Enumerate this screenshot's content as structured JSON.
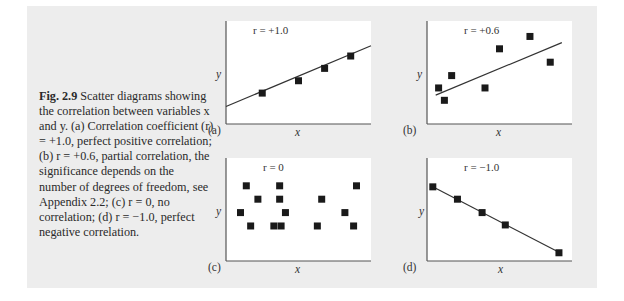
{
  "caption": {
    "figure_label": "Fig. 2.9",
    "text": "Scatter diagrams showing the correlation between variables x and y. (a) Correlation coefficient (r) = +1.0, perfect positive correlation; (b) r = +0.6, partial correlation, the significance depends on the number of degrees of freedom, see Appendix 2.2; (c) r = 0, no correlation; (d) r = −1.0, perfect negative correlation."
  },
  "chart_data": [
    {
      "type": "scatter",
      "panel": "(a)",
      "annotation": "r = +1.0",
      "xlabel": "x",
      "ylabel": "y",
      "trendline": true,
      "points": [
        [
          25,
          30
        ],
        [
          50,
          42
        ],
        [
          68,
          54
        ],
        [
          86,
          66
        ]
      ],
      "line": [
        [
          0,
          17
        ],
        [
          100,
          76
        ]
      ],
      "xlim": [
        0,
        100
      ],
      "ylim": [
        0,
        100
      ]
    },
    {
      "type": "scatter",
      "panel": "(b)",
      "annotation": "r = +0.6",
      "xlabel": "x",
      "ylabel": "y",
      "trendline": true,
      "points": [
        [
          8,
          35
        ],
        [
          12,
          23
        ],
        [
          17,
          47
        ],
        [
          40,
          35
        ],
        [
          50,
          73
        ],
        [
          71,
          85
        ],
        [
          85,
          60
        ]
      ],
      "line": [
        [
          6,
          28
        ],
        [
          93,
          79
        ]
      ],
      "xlim": [
        0,
        100
      ],
      "ylim": [
        0,
        100
      ]
    },
    {
      "type": "scatter",
      "panel": "(c)",
      "annotation": "r = 0",
      "xlabel": "x",
      "ylabel": "y",
      "trendline": false,
      "points": [
        [
          14,
          73
        ],
        [
          22,
          60
        ],
        [
          10,
          47
        ],
        [
          17,
          34
        ],
        [
          37,
          73
        ],
        [
          37,
          60
        ],
        [
          41,
          47
        ],
        [
          33,
          34
        ],
        [
          38,
          34
        ],
        [
          66,
          60
        ],
        [
          63,
          34
        ],
        [
          82,
          47
        ],
        [
          90,
          73
        ],
        [
          88,
          34
        ]
      ],
      "xlim": [
        0,
        100
      ],
      "ylim": [
        0,
        100
      ]
    },
    {
      "type": "scatter",
      "panel": "(d)",
      "annotation": "r = −1.0",
      "xlabel": "x",
      "ylabel": "y",
      "trendline": true,
      "points": [
        [
          4,
          72
        ],
        [
          21,
          60
        ],
        [
          38,
          47
        ],
        [
          54,
          35
        ],
        [
          91,
          8
        ]
      ],
      "line": [
        [
          4,
          72
        ],
        [
          93,
          7
        ]
      ],
      "xlim": [
        0,
        100
      ],
      "ylim": [
        0,
        100
      ]
    }
  ],
  "panels": [
    {
      "label": "(a)",
      "r_text": "r = +1.0"
    },
    {
      "label": "(b)",
      "r_text": "r = +0.6"
    },
    {
      "label": "(c)",
      "r_text": "r = 0"
    },
    {
      "label": "(d)",
      "r_text": "r = −1.0"
    }
  ],
  "axis": {
    "x": "x",
    "y": "y"
  }
}
